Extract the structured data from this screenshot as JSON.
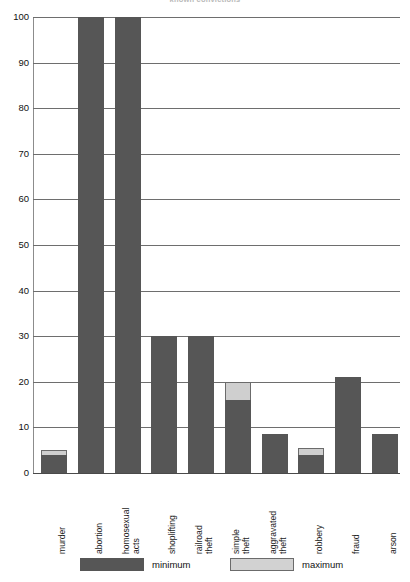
{
  "chart_data": {
    "type": "bar",
    "title": "known convictions",
    "xlabel": "",
    "ylabel": "",
    "ylim": [
      0,
      100
    ],
    "yticks": [
      0,
      10,
      20,
      30,
      40,
      50,
      60,
      70,
      80,
      90,
      100
    ],
    "grid": true,
    "legend_position": "bottom",
    "categories": [
      "murder",
      "abortion",
      "homosexual\nacts",
      "shoplifting",
      "railroad\ntheft",
      "simple\ntheft",
      "aggravated\ntheft",
      "robbery",
      "fraud",
      "arson"
    ],
    "series": [
      {
        "name": "minimum",
        "color": "#565656",
        "values": [
          4,
          100,
          100,
          30,
          30,
          16,
          8.5,
          4,
          21,
          8.5
        ]
      },
      {
        "name": "maximum",
        "color": "#d2d2d2",
        "values": [
          5,
          100,
          100,
          30,
          30,
          20,
          8.5,
          5.5,
          21,
          8.5
        ]
      }
    ]
  },
  "legend": {
    "minimum_label": "minimum",
    "maximum_label": "maximum"
  },
  "colors": {
    "minimum": "#565656",
    "maximum": "#d2d2d2",
    "gridline": "#6e6e6e",
    "axis": "#4a4a4a",
    "background": "#ffffff"
  }
}
